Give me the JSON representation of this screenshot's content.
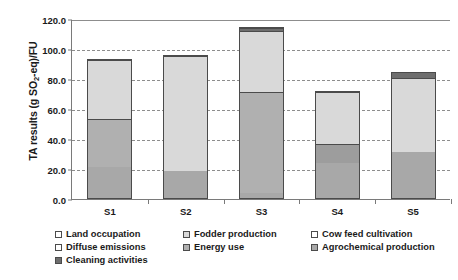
{
  "chart_data": {
    "type": "bar",
    "subtype": "stacked-vertical",
    "title": "",
    "xlabel": "",
    "ylabel": "TA results (g SO2-eq)/FU",
    "ylabel_rich": {
      "pre": "TA results (g SO",
      "sub": "2",
      "post": "-eq)/FU"
    },
    "categories": [
      "S1",
      "S2",
      "S3",
      "S4",
      "S5"
    ],
    "ylim": [
      0.0,
      120.0
    ],
    "yticks": [
      0.0,
      20.0,
      40.0,
      60.0,
      80.0,
      100.0,
      120.0
    ],
    "ytick_labels": [
      "0.0",
      "20.0",
      "40.0",
      "60.0",
      "80.0",
      "100.0",
      "120.0"
    ],
    "grid": "horizontal-dashed",
    "legend_position": "bottom",
    "series": [
      {
        "name": "Land occupation",
        "color": "#ffffff",
        "values": [
          0.0,
          0.0,
          0.0,
          0.0,
          0.0
        ]
      },
      {
        "name": "Fodder production",
        "color": "#d9d9d9",
        "values": [
          40.0,
          78.0,
          41.0,
          35.5,
          50.5
        ]
      },
      {
        "name": "Cow feed cultivation",
        "color": "#d9d9d9",
        "values": [
          0.0,
          0.0,
          0.0,
          0.0,
          0.0
        ]
      },
      {
        "name": "Diffuse emissions",
        "color": "#ffffff",
        "values": [
          0.0,
          0.0,
          0.0,
          0.0,
          0.0
        ]
      },
      {
        "name": "Energy use",
        "color": "#b0b0b0",
        "values": [
          32.0,
          0.0,
          68.0,
          0.0,
          0.0
        ]
      },
      {
        "name": "Agrochemical production",
        "color": "#a8a8a8",
        "values": [
          0.0,
          0.0,
          0.0,
          13.0,
          0.0
        ]
      },
      {
        "name": "Cleaning activities",
        "color": "#6e6e6e",
        "values": [
          0.0,
          0.0,
          2.5,
          0.0,
          3.5
        ]
      }
    ],
    "stack_totals": [
      93.3,
      96.0,
      115.0,
      72.0,
      85.0
    ],
    "stacks": [
      {
        "category": "S1",
        "total": 93.3,
        "segments": [
          {
            "label": "Agrochemical production",
            "value": 21.3,
            "color": "#a8a8a8"
          },
          {
            "label": "Energy use",
            "value": 32.0,
            "color": "#b0b0b0"
          },
          {
            "label": "Fodder production",
            "value": 40.0,
            "color": "#d9d9d9"
          }
        ]
      },
      {
        "category": "S2",
        "total": 96.0,
        "segments": [
          {
            "label": "Agrochemical production",
            "value": 18.0,
            "color": "#a8a8a8"
          },
          {
            "label": "Fodder production",
            "value": 78.0,
            "color": "#d9d9d9"
          }
        ]
      },
      {
        "category": "S3",
        "total": 115.0,
        "segments": [
          {
            "label": "Agrochemical production",
            "value": 3.5,
            "color": "#a8a8a8"
          },
          {
            "label": "Energy use",
            "value": 68.0,
            "color": "#b0b0b0"
          },
          {
            "label": "Fodder production",
            "value": 41.0,
            "color": "#d9d9d9"
          },
          {
            "label": "Cleaning activities",
            "value": 2.5,
            "color": "#6e6e6e"
          }
        ]
      },
      {
        "category": "S4",
        "total": 72.0,
        "segments": [
          {
            "label": "Agrochemical production",
            "value": 23.5,
            "color": "#a8a8a8"
          },
          {
            "label": "Energy use",
            "value": 13.0,
            "color": "#9d9d9d"
          },
          {
            "label": "Fodder production",
            "value": 35.5,
            "color": "#d9d9d9"
          }
        ]
      },
      {
        "category": "S5",
        "total": 85.0,
        "segments": [
          {
            "label": "Agrochemical production",
            "value": 31.0,
            "color": "#a8a8a8"
          },
          {
            "label": "Fodder production",
            "value": 50.5,
            "color": "#d9d9d9"
          },
          {
            "label": "Cleaning activities",
            "value": 3.5,
            "color": "#6e6e6e"
          }
        ]
      }
    ],
    "legend": [
      {
        "label": "Land occupation",
        "color": "#ffffff"
      },
      {
        "label": "Fodder production",
        "color": "#d9d9d9"
      },
      {
        "label": "Cow feed cultivation",
        "color": "#ffffff"
      },
      {
        "label": "Diffuse emissions",
        "color": "#ffffff"
      },
      {
        "label": "Energy use",
        "color": "#b0b0b0"
      },
      {
        "label": "Agrochemical production",
        "color": "#a8a8a8"
      },
      {
        "label": "Cleaning activities",
        "color": "#6e6e6e"
      }
    ]
  },
  "colors": {
    "axis": "#7a7a7a",
    "grid": "#8d8d8d",
    "bar_outline": "#4b4b4b",
    "text": "#1a1a1a",
    "background": "#ffffff"
  }
}
